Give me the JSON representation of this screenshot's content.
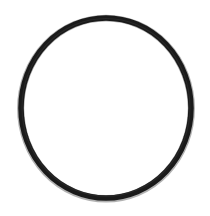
{
  "image": {
    "alt_text": "O-Ring",
    "width": 210,
    "height": 216,
    "background_color": "#ffffff"
  },
  "subject": {
    "name": "o-ring",
    "label": "O-Ring",
    "shape": "ring",
    "stroke_color": "#1a1a1a",
    "fill_color": "#ffffff",
    "center_x": 106,
    "center_y": 108,
    "radius_x": 85,
    "radius_y": 90,
    "stroke_width": 5.5,
    "inner_highlight_color": "#3a3a3a"
  }
}
